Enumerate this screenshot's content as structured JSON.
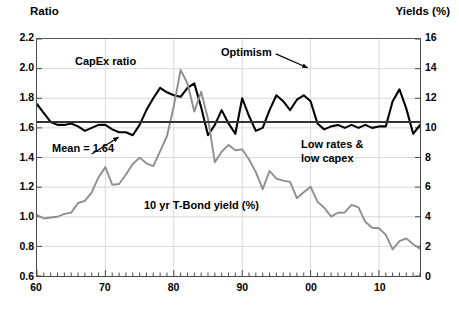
{
  "header": {
    "left_axis_title": "Ratio",
    "right_axis_title": "Yields (%)"
  },
  "chart_data": {
    "type": "line",
    "title": "",
    "xlabel": "",
    "ylabel": "Ratio",
    "y2label": "Yields (%)",
    "xlim": [
      1960,
      2016
    ],
    "ylim": [
      0.6,
      2.2
    ],
    "y2lim": [
      0,
      16
    ],
    "grid": true,
    "legend_position": "inline-annotations",
    "yticks": [
      "2.2",
      "2.0",
      "1.8",
      "1.6",
      "1.4",
      "1.2",
      "1.0",
      "0.8",
      "0.6"
    ],
    "ytick_values": [
      2.2,
      2.0,
      1.8,
      1.6,
      1.4,
      1.2,
      1.0,
      0.8,
      0.6
    ],
    "y2ticks": [
      "16",
      "14",
      "12",
      "10",
      "8",
      "6",
      "4",
      "2",
      "0"
    ],
    "y2tick_values": [
      16,
      14,
      12,
      10,
      8,
      6,
      4,
      2,
      0
    ],
    "xticks": [
      "60",
      "70",
      "80",
      "90",
      "00",
      "10"
    ],
    "xtick_values": [
      1960,
      1970,
      1980,
      1990,
      2000,
      2010
    ],
    "minor_xtick_interval": 1,
    "reference_line": {
      "label": "Mean = 1.64",
      "value": 1.64,
      "axis": "left",
      "color": "#333333"
    },
    "series": [
      {
        "name": "CapEx ratio",
        "axis": "left",
        "color": "#000000",
        "width": 2.1,
        "x": [
          1960,
          1961,
          1962,
          1963,
          1964,
          1965,
          1966,
          1967,
          1968,
          1969,
          1970,
          1971,
          1972,
          1973,
          1974,
          1975,
          1976,
          1977,
          1978,
          1979,
          1980,
          1981,
          1982,
          1983,
          1984,
          1985,
          1986,
          1987,
          1988,
          1989,
          1990,
          1991,
          1992,
          1993,
          1994,
          1995,
          1996,
          1997,
          1998,
          1999,
          2000,
          2001,
          2002,
          2003,
          2004,
          2005,
          2006,
          2007,
          2008,
          2009,
          2010,
          2011,
          2012,
          2013,
          2014,
          2015,
          2016
        ],
        "values": [
          1.76,
          1.7,
          1.64,
          1.62,
          1.62,
          1.63,
          1.61,
          1.58,
          1.6,
          1.62,
          1.62,
          1.59,
          1.57,
          1.57,
          1.55,
          1.62,
          1.72,
          1.8,
          1.87,
          1.84,
          1.82,
          1.81,
          1.87,
          1.9,
          1.74,
          1.55,
          1.62,
          1.72,
          1.63,
          1.56,
          1.8,
          1.68,
          1.58,
          1.6,
          1.72,
          1.82,
          1.78,
          1.72,
          1.79,
          1.82,
          1.78,
          1.63,
          1.59,
          1.61,
          1.62,
          1.6,
          1.62,
          1.6,
          1.62,
          1.6,
          1.61,
          1.61,
          1.78,
          1.86,
          1.73,
          1.56,
          1.62
        ]
      },
      {
        "name": "10 yr T-Bond yield (%)",
        "axis": "right",
        "color": "#8e8e8e",
        "width": 1.9,
        "x": [
          1960,
          1961,
          1962,
          1963,
          1964,
          1965,
          1966,
          1967,
          1968,
          1969,
          1970,
          1971,
          1972,
          1973,
          1974,
          1975,
          1976,
          1977,
          1978,
          1979,
          1980,
          1981,
          1982,
          1983,
          1984,
          1985,
          1986,
          1987,
          1988,
          1989,
          1990,
          1991,
          1992,
          1993,
          1994,
          1995,
          1996,
          1997,
          1998,
          1999,
          2000,
          2001,
          2002,
          2003,
          2004,
          2005,
          2006,
          2007,
          2008,
          2009,
          2010,
          2011,
          2012,
          2013,
          2014,
          2015,
          2016
        ],
        "values": [
          4.12,
          3.88,
          3.95,
          4.0,
          4.19,
          4.28,
          4.93,
          5.07,
          5.65,
          6.67,
          7.35,
          6.16,
          6.21,
          6.85,
          7.56,
          7.99,
          7.61,
          7.42,
          8.41,
          9.44,
          11.46,
          13.91,
          13.0,
          11.1,
          12.44,
          10.62,
          7.68,
          8.39,
          8.85,
          8.49,
          8.55,
          7.86,
          7.01,
          5.87,
          7.09,
          6.57,
          6.44,
          6.35,
          5.26,
          5.65,
          6.03,
          5.02,
          4.61,
          4.01,
          4.27,
          4.29,
          4.8,
          4.63,
          3.66,
          3.26,
          3.22,
          2.78,
          1.8,
          2.35,
          2.54,
          2.14,
          1.84
        ]
      }
    ],
    "annotations": [
      {
        "text": "CapEx ratio",
        "kind": "series-label"
      },
      {
        "text": "Optimism",
        "kind": "callout",
        "points_to_year": 2000,
        "points_to_value": 2.0
      },
      {
        "text": "Mean = 1.64",
        "kind": "callout",
        "points_to_value": 1.64
      },
      {
        "text": "Low rates &",
        "kind": "note"
      },
      {
        "text": "low capex",
        "kind": "note"
      },
      {
        "text": "10 yr T-Bond yield (%)",
        "kind": "series-label"
      }
    ]
  },
  "annotations": {
    "capex_label": "CapEx ratio",
    "optimism_label": "Optimism",
    "mean_label": "Mean = 1.64",
    "low_rates_line1": "Low rates &",
    "low_rates_line2": "low capex",
    "tbond_label": "10 yr T-Bond yield (%)"
  },
  "colors": {
    "capex_line": "#000000",
    "tbond_line": "#8e8e8e",
    "mean_line": "#333333",
    "grid": "#d8d8d8",
    "axis": "#4a4a4a",
    "text": "#000000",
    "background": "#ffffff"
  }
}
